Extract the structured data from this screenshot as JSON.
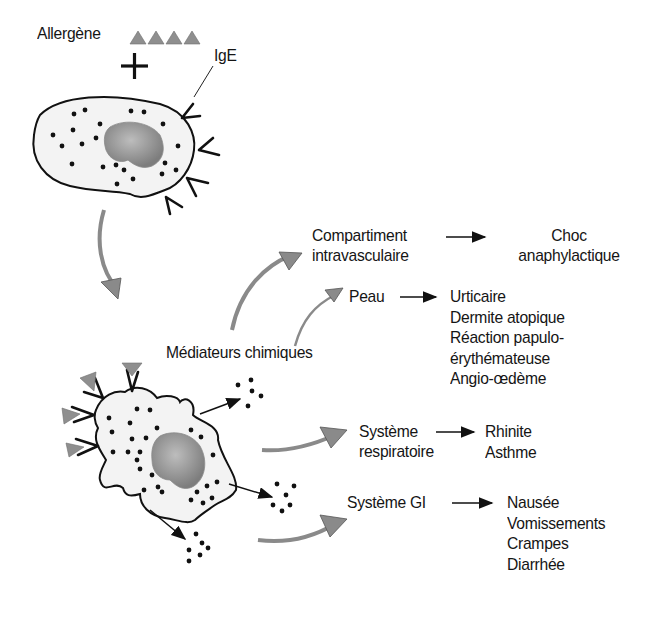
{
  "diagram": {
    "type": "flow",
    "language": "fr",
    "colors": {
      "outline": "#111111",
      "cell_fill": "#f2f2f2",
      "nucleus": "#8c8c8c",
      "arrow_gray": "#8a8a8a",
      "allergen": "#8f8f8f"
    },
    "top_cell": {
      "allergen_label": "Allergène",
      "allergen_icon_count": 4,
      "plus_sign": "+",
      "antibody_label": "IgE"
    },
    "bottom_cell": {
      "mediators_label": "Médiateurs chimiques"
    },
    "targets": [
      {
        "id": "intravascular",
        "label_lines": [
          "Compartiment",
          "intravasculaire"
        ],
        "effects": [
          "Choc",
          "anaphylactique"
        ]
      },
      {
        "id": "skin",
        "label_lines": [
          "Peau"
        ],
        "effects": [
          "Urticaire",
          "Dermite atopique",
          "Réaction papulo-",
          "érythémateuse",
          "Angio-œdème"
        ]
      },
      {
        "id": "respiratory",
        "label_lines": [
          "Système",
          "respiratoire"
        ],
        "effects": [
          "Rhinite",
          "Asthme"
        ]
      },
      {
        "id": "gi",
        "label_lines": [
          "Système GI"
        ],
        "effects": [
          "Nausée",
          "Vomissements",
          "Crampes",
          "Diarrhée"
        ]
      }
    ]
  }
}
